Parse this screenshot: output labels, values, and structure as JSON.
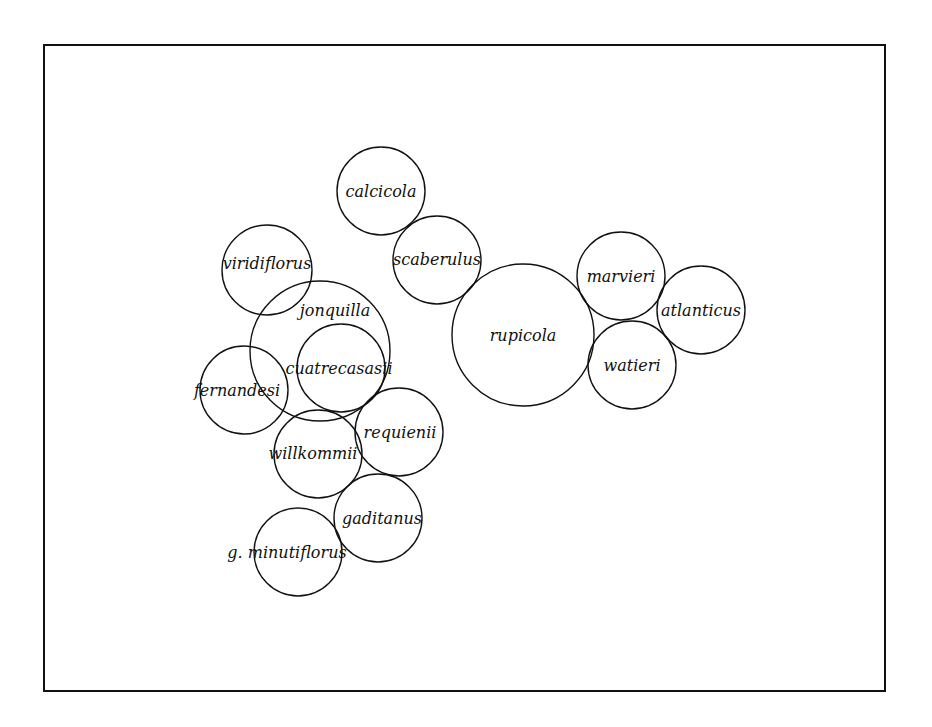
{
  "diagram": {
    "type": "overlap-circle-diagram",
    "stroke_color": "#111111",
    "background": "#ffffff",
    "nodes": [
      {
        "id": "calcicola",
        "label": "calcicola",
        "cx": 381,
        "cy": 191,
        "r": 44,
        "lx": 381,
        "ly": 197
      },
      {
        "id": "scaberulus",
        "label": "scaberulus",
        "cx": 437,
        "cy": 260,
        "r": 44,
        "lx": 437,
        "ly": 265
      },
      {
        "id": "viridiflorus",
        "label": "viridiflorus",
        "cx": 267,
        "cy": 270,
        "r": 45,
        "lx": 267,
        "ly": 269
      },
      {
        "id": "jonquilla",
        "label": "jonquilla",
        "cx": 320,
        "cy": 351,
        "r": 70,
        "lx": 335,
        "ly": 316
      },
      {
        "id": "cuatrecasasii",
        "label": "cuatrecasasii",
        "cx": 341,
        "cy": 368,
        "r": 44,
        "lx": 339,
        "ly": 374
      },
      {
        "id": "fernandesi",
        "label": "fernandesi",
        "cx": 244,
        "cy": 390,
        "r": 44,
        "lx": 237,
        "ly": 396
      },
      {
        "id": "requienii",
        "label": "requienii",
        "cx": 399,
        "cy": 432,
        "r": 44,
        "lx": 400,
        "ly": 438
      },
      {
        "id": "willkommii",
        "label": "willkommii",
        "cx": 318,
        "cy": 454,
        "r": 44,
        "lx": 313,
        "ly": 459
      },
      {
        "id": "gaditanus",
        "label": "gaditanus",
        "cx": 378,
        "cy": 518,
        "r": 44,
        "lx": 382,
        "ly": 524
      },
      {
        "id": "g-minutiflorus",
        "label": "g. minutiflorus",
        "cx": 298,
        "cy": 552,
        "r": 44,
        "lx": 287,
        "ly": 558
      },
      {
        "id": "rupicola",
        "label": "rupicola",
        "cx": 523,
        "cy": 335,
        "r": 71,
        "lx": 523,
        "ly": 341
      },
      {
        "id": "marvieri",
        "label": "marvieri",
        "cx": 621,
        "cy": 276,
        "r": 44,
        "lx": 621,
        "ly": 282
      },
      {
        "id": "atlanticus",
        "label": "atlanticus",
        "cx": 701,
        "cy": 310,
        "r": 44,
        "lx": 701,
        "ly": 316
      },
      {
        "id": "watieri",
        "label": "watieri",
        "cx": 632,
        "cy": 365,
        "r": 44,
        "lx": 632,
        "ly": 371
      }
    ]
  }
}
